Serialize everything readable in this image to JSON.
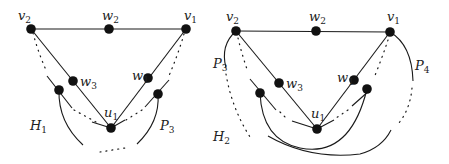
{
  "figure": {
    "left_graph": {
      "name": "H1 configuration",
      "vertices": {
        "v2": {
          "label": "v",
          "sub": "2",
          "x": 31,
          "y": 29
        },
        "w2": {
          "label": "w",
          "sub": "2",
          "x": 109,
          "y": 29
        },
        "v1": {
          "label": "v",
          "sub": "1",
          "x": 186,
          "y": 29
        },
        "w3": {
          "label": "w",
          "sub": "3",
          "x": 73,
          "y": 81
        },
        "w1": {
          "label": "w",
          "sub": "1",
          "x": 148,
          "y": 78
        },
        "u1": {
          "label": "u",
          "sub": "1",
          "x": 111,
          "y": 128
        }
      },
      "region_label": {
        "label": "H",
        "sub": "1"
      },
      "path_label": {
        "label": "P",
        "sub": "3"
      }
    },
    "right_graph": {
      "name": "H2 configuration",
      "vertices": {
        "v2": {
          "label": "v",
          "sub": "2",
          "x": 236,
          "y": 31
        },
        "w2": {
          "label": "w",
          "sub": "2",
          "x": 316,
          "y": 31
        },
        "v1": {
          "label": "v",
          "sub": "1",
          "x": 390,
          "y": 32
        },
        "w3": {
          "label": "w",
          "sub": "3",
          "x": 279,
          "y": 83
        },
        "w1": {
          "label": "w",
          "sub": "1",
          "x": 354,
          "y": 80
        },
        "u1": {
          "label": "u",
          "sub": "1",
          "x": 317,
          "y": 129
        }
      },
      "region_label": {
        "label": "H",
        "sub": "2"
      },
      "path_labels": [
        {
          "label": "P",
          "sub": "3"
        },
        {
          "label": "P",
          "sub": "4"
        }
      ]
    },
    "colors": {
      "ink": "#111111",
      "background": "#ffffff"
    }
  }
}
